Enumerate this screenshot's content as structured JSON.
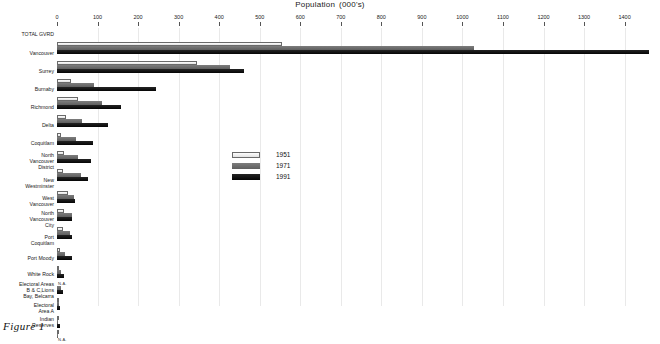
{
  "figure": {
    "caption": "Figure 1",
    "title": "Population",
    "title_units": "(000's)"
  },
  "legend": {
    "position": "center",
    "items": [
      {
        "label": "1951",
        "color": "#ececec"
      },
      {
        "label": "1971",
        "color": "#6e6e6e"
      },
      {
        "label": "1991",
        "color": "#141414"
      }
    ]
  },
  "axis": {
    "xlabel": "Population  (000's)",
    "ticks": [
      0,
      100,
      200,
      300,
      400,
      500,
      600,
      700,
      800,
      900,
      1000,
      1100,
      1200,
      1300,
      1400
    ],
    "xmin": 0,
    "xmax": 1470,
    "na_text": "N.A."
  },
  "chart_data": {
    "type": "bar",
    "orientation": "horizontal",
    "xlabel": "Population (000's)",
    "ylabel": "",
    "xlim": [
      0,
      1470
    ],
    "grid": true,
    "legend_position": "center",
    "categories": [
      "TOTAL GVRD",
      "Vancouver",
      "Surrey",
      "Burnaby",
      "Richmond",
      "Delta",
      "Coquitlam",
      "North Vancouver District",
      "New Westminster",
      "West Vancouver",
      "North Vancouver City",
      "Port Coquitlam",
      "Port Moody",
      "White Rock",
      "Electoral Areas B & C,Lions Bay, Belcarra",
      "Electoral Area A",
      "Indian Reserves"
    ],
    "category_lines": [
      [
        "TOTAL GVRD"
      ],
      [
        "Vancouver"
      ],
      [
        "Surrey"
      ],
      [
        "Burnaby"
      ],
      [
        "Richmond"
      ],
      [
        "Delta"
      ],
      [
        "Coquitlam"
      ],
      [
        "North",
        "Vancouver",
        "District"
      ],
      [
        "New",
        "Westminster"
      ],
      [
        "West",
        "Vancouver"
      ],
      [
        "North",
        "Vancouver",
        "City"
      ],
      [
        "Port",
        "Coquitlam"
      ],
      [
        "Port Moody"
      ],
      [
        "White Rock"
      ],
      [
        "Electoral Areas",
        "B & C,Lions",
        "Bay, Belcarra"
      ],
      [
        "Electoral",
        "Area A"
      ],
      [
        "Indian",
        "Reserves"
      ]
    ],
    "series": [
      {
        "name": "1951",
        "color": "#ececec",
        "values": [
          556,
          345,
          35,
          52,
          22,
          9,
          17,
          16,
          27,
          18,
          16,
          7,
          4,
          null,
          3,
          2,
          2
        ]
      },
      {
        "name": "1971",
        "color": "#6e6e6e",
        "values": [
          1028,
          426,
          92,
          112,
          62,
          46,
          53,
          58,
          42,
          36,
          31,
          19,
          11,
          11,
          5,
          3,
          3
        ]
      },
      {
        "name": "1991",
        "color": "#141414",
        "values": [
          1460,
          462,
          245,
          158,
          126,
          88,
          84,
          76,
          44,
          38,
          38,
          36,
          17,
          16,
          8,
          7,
          null
        ]
      }
    ],
    "missing_markers": [
      {
        "category": "White Rock",
        "series": "1951",
        "text": "N.A."
      },
      {
        "category": "Indian Reserves",
        "series": "1991",
        "text": "N.A."
      }
    ]
  }
}
